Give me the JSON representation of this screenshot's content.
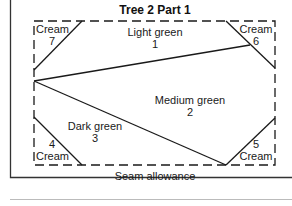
{
  "title": "Tree 2 Part 1",
  "footer_label": "Seam allowance",
  "regions": [
    {
      "id": 1,
      "name": "Light green",
      "number": "1"
    },
    {
      "id": 2,
      "name": "Medium green",
      "number": "2"
    },
    {
      "id": 3,
      "name": "Dark green",
      "number": "3"
    },
    {
      "id": 4,
      "name": "Cream",
      "number": "4"
    },
    {
      "id": 5,
      "name": "Cream",
      "number": "5"
    },
    {
      "id": 6,
      "name": "Cream",
      "number": "6"
    },
    {
      "id": 7,
      "name": "Cream",
      "number": "7"
    }
  ],
  "colors": {
    "line": "#1a1a1a",
    "frame": "#333333",
    "separator": "#bbbbbb"
  }
}
